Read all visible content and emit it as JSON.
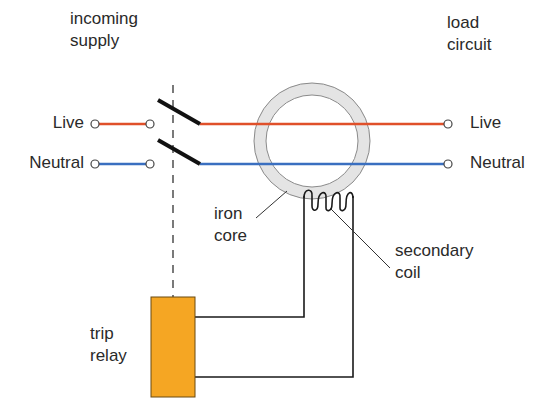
{
  "labels": {
    "incoming_supply": [
      "incoming",
      "supply"
    ],
    "load_circuit": [
      "load",
      "circuit"
    ],
    "live_left": "Live",
    "neutral_left": "Neutral",
    "live_right": "Live",
    "neutral_right": "Neutral",
    "iron_core": [
      "iron",
      "core"
    ],
    "secondary_coil": [
      "secondary",
      "coil"
    ],
    "trip_relay": [
      "trip",
      "relay"
    ]
  },
  "colors": {
    "live": "#e0502a",
    "neutral": "#3a6fc0",
    "core_fill": "#e4e4e4",
    "core_stroke": "#8a8a8a",
    "relay_fill": "#f5a623",
    "relay_stroke": "#6b4a10",
    "wire": "#1a1a1a"
  }
}
